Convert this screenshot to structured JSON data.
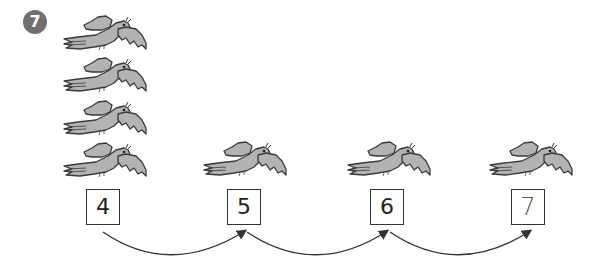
{
  "exercise": {
    "number": "7",
    "badge_color": "#707070"
  },
  "bird_groups": [
    {
      "count": 4
    },
    {
      "count": 1
    },
    {
      "count": 1
    },
    {
      "count": 1
    }
  ],
  "number_boxes": [
    {
      "value": "4",
      "handwritten": false
    },
    {
      "value": "5",
      "handwritten": false
    },
    {
      "value": "6",
      "handwritten": false
    },
    {
      "value": "7",
      "handwritten": true
    }
  ],
  "colors": {
    "bird_fill": "#b3b3b3",
    "bird_outline": "#3a3a3a",
    "box_border": "#333333",
    "arrow": "#333333"
  }
}
